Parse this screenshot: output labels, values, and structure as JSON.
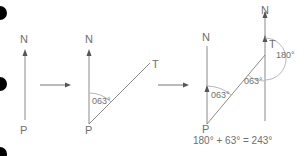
{
  "colors": {
    "line": "#8a8a8a",
    "text": "#6f6f6f",
    "bullet": "#000000",
    "arc": "#b8b8b8"
  },
  "bullets": 3,
  "panel1": {
    "north_label": "N",
    "point_label": "P"
  },
  "panel2": {
    "north_label": "N",
    "point_label": "P",
    "target_label": "T",
    "angle_label": "063°"
  },
  "panel3": {
    "north_label_p": "N",
    "north_label_t": "N",
    "point_label": "P",
    "target_label": "T",
    "angle_at_p": "063°",
    "angle_at_t": "063°",
    "straight_angle": "180°",
    "equation": "180° + 63° = 243°"
  }
}
